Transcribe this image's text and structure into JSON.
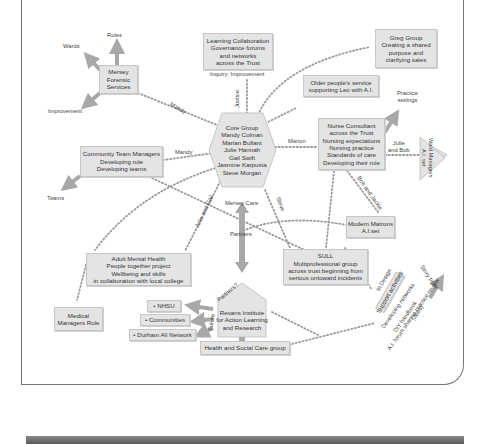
{
  "diagram": {
    "hub": {
      "shape": "hexagon",
      "lines": [
        "Core Group",
        "Mandy Colman",
        "Marian Bullant",
        "Julie Hannah",
        "Gail Swift",
        "Jasmine Karpusta",
        "Steve Morgan"
      ]
    },
    "nodes": {
      "mersey_forensic": [
        "Mersey",
        "Forensic",
        "Services"
      ],
      "learning_collab": [
        "Learning Collaboration",
        "Governance forums",
        "and networks",
        "across the Trust"
      ],
      "greg_group": [
        "Greg Group",
        "Creating a shared",
        "purpose and",
        "clarifying sales"
      ],
      "older_people": [
        "Older people's service",
        "supporting Leo with A.I."
      ],
      "community_team": [
        "Community Team Managers",
        "Developing role",
        "Developing teams"
      ],
      "nurse_consultant": [
        "Nurse Consultant",
        "across the Trust",
        "Nursing expectations",
        "Nursing practice",
        "Standards of care",
        "Developing their role"
      ],
      "ward_managers": [
        "Ward Managers",
        "A.I. set"
      ],
      "modern_matrons": [
        "Modern Matrons",
        "A.I.set"
      ],
      "sull": [
        "SULL",
        "Multiprofessional group",
        "across trust beginning from",
        "serious untoward incidents"
      ],
      "adult_mental_health": [
        "Adult Mental Health",
        "People together project",
        "Wellbeing and skills",
        "in collaboration with local college"
      ],
      "medical_managers": [
        "Medical",
        "Managers Role"
      ],
      "revans": [
        "Revans Institute",
        "for Action Learning",
        "and Research"
      ],
      "health_social_care": "Health and Social Care group",
      "nhsu": "• NHSU",
      "communities": "• Communities",
      "durham": "• Durham All Network",
      "support_activities": "Support activities"
    },
    "labels": {
      "roles": "Roles",
      "wards": "Wards",
      "improvement": "Improvement",
      "inquiry": "Inquiry: Improvement",
      "justice": "Justice",
      "mandy_1": "Mandy",
      "mandy_2": "Mandy",
      "marion": "Marion",
      "practice_settings": [
        "Practice",
        "settings"
      ],
      "julie_and_bob": [
        "Julie",
        "and Bob"
      ],
      "bob_and_jackie": "Bob and Jackie",
      "teams": "Teams",
      "julie_and_gail": "Julie and Gail",
      "mersey_care": "Mersey Care",
      "steve": "Steve",
      "partners": "Partners",
      "partners_q": "Partners?",
      "future": "Future",
      "in_design": "In Design",
      "story_book": "Story book",
      "developing_networks": "Developing networks",
      "diy_handbook": "DIY handbook",
      "ai_forum": "A.I. forum sharing practice review",
      "year": "(2004)"
    },
    "colors": {
      "box_fill": "#e4e4e4",
      "box_border": "#c6c6c6",
      "dots": "#9a9a9a",
      "arrow": "#a8a8a8",
      "frame": "#777777"
    }
  }
}
